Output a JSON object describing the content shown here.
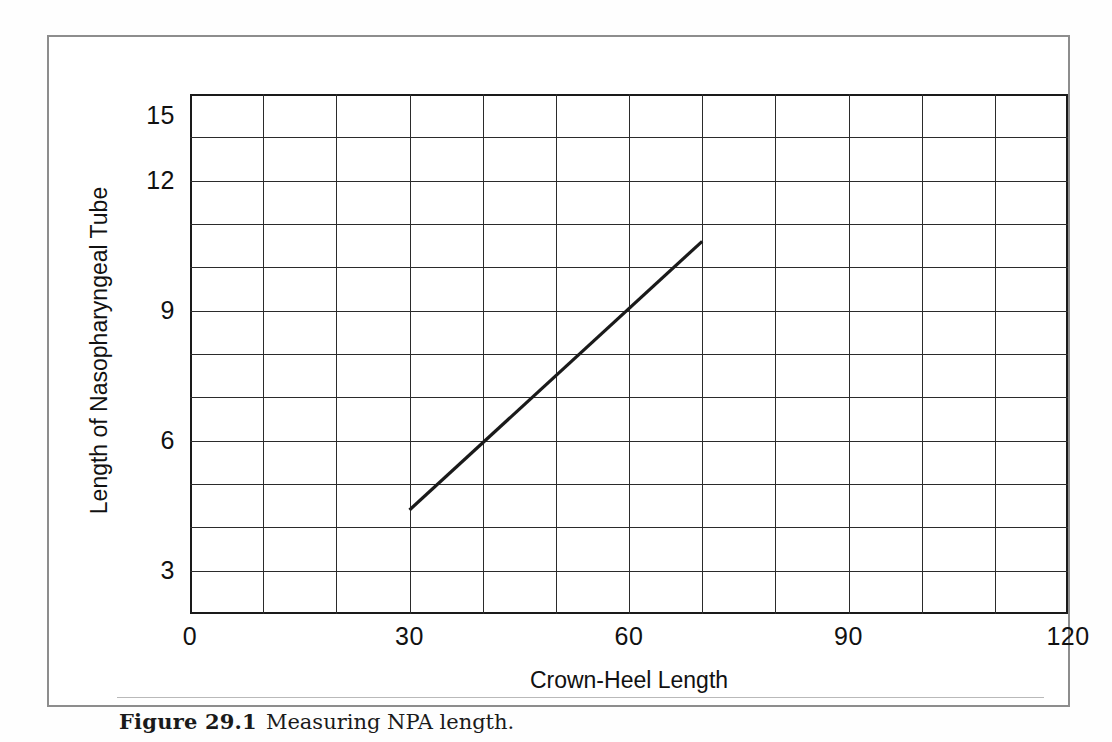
{
  "figure": {
    "caption_number": "Figure 29.1",
    "caption_text": "Measuring NPA length."
  },
  "chart_data": {
    "type": "line",
    "title": "",
    "xlabel": "Crown-Heel Length",
    "ylabel": "Length of Nasopharyngeal Tube",
    "xlim": [
      0,
      120
    ],
    "ylim": [
      1,
      13
    ],
    "xticks": [
      0,
      30,
      60,
      90,
      120
    ],
    "xtick_labels": [
      "0",
      "30",
      "60",
      "90",
      "120"
    ],
    "yticks": [
      3,
      6,
      9,
      12,
      15
    ],
    "ytick_labels": [
      "3",
      "6",
      "9",
      "12",
      "15"
    ],
    "x_gridline_step": 10,
    "y_gridline_step": 1,
    "grid": true,
    "legend": false,
    "series": [
      {
        "name": "NPA length vs crown-heel length",
        "x": [
          30,
          70
        ],
        "y": [
          3.4,
          9.6
        ],
        "color": "#1a1a1a",
        "width": 3
      }
    ]
  }
}
